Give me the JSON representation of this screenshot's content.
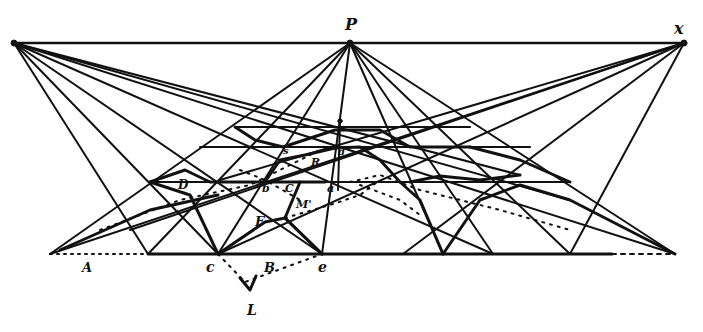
{
  "figure": {
    "type": "perspective construction of octagonal pavement",
    "colors": {
      "ink": "#111111",
      "paper": "#ffffff"
    }
  },
  "points": {
    "P": {
      "label": "P",
      "x": 350,
      "y": 43,
      "role": "principal vanishing point"
    },
    "x": {
      "label": "x",
      "x": 684,
      "y": 43,
      "role": "right distance point"
    },
    "xl": {
      "label": "",
      "x": 14,
      "y": 43,
      "role": "left distance point"
    }
  },
  "lines": {
    "horizon": {
      "x1": 14,
      "y1": 43,
      "x2": 684,
      "y2": 43
    },
    "ground": {
      "x1": 50,
      "y1": 254,
      "x2": 675,
      "y2": 254
    }
  },
  "labels": [
    {
      "id": "label-P",
      "text": "P",
      "x": 345,
      "y": 30
    },
    {
      "id": "label-x",
      "text": "x",
      "x": 674,
      "y": 34
    },
    {
      "id": "label-A",
      "text": "A",
      "x": 82,
      "y": 272
    },
    {
      "id": "label-c",
      "text": "c",
      "x": 206,
      "y": 272
    },
    {
      "id": "label-B",
      "text": "B",
      "x": 264,
      "y": 272
    },
    {
      "id": "label-e",
      "text": "e",
      "x": 318,
      "y": 272
    },
    {
      "id": "label-L",
      "text": "L",
      "x": 247,
      "y": 315
    },
    {
      "id": "label-D",
      "text": "D",
      "x": 178,
      "y": 189
    },
    {
      "id": "label-b",
      "text": "b",
      "x": 262,
      "y": 192
    },
    {
      "id": "label-C",
      "text": "C",
      "x": 285,
      "y": 192
    },
    {
      "id": "label-a",
      "text": "a",
      "x": 327,
      "y": 192
    },
    {
      "id": "label-s",
      "text": "s",
      "x": 283,
      "y": 154
    },
    {
      "id": "label-R",
      "text": "R",
      "x": 311,
      "y": 166
    },
    {
      "id": "label-d",
      "text": "d",
      "x": 338,
      "y": 155
    },
    {
      "id": "label-M",
      "text": "M'",
      "x": 296,
      "y": 208
    },
    {
      "id": "label-F",
      "text": "F",
      "x": 255,
      "y": 226
    }
  ]
}
